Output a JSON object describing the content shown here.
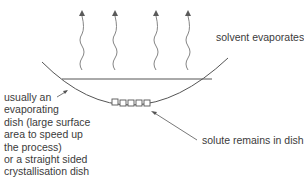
{
  "diagram": {
    "labels": {
      "solvent": "solvent evaporates",
      "solute": "solute remains in dish",
      "dish_lines": [
        "usually an",
        "evaporating",
        "dish (large surface",
        "area to speed up",
        "the process)",
        "or a straight sided",
        "crystallisation dish"
      ]
    },
    "elements": {
      "vapour_arrows": 4,
      "solute_crystals": 5
    },
    "colors": {
      "line": "#555555",
      "arrow": "#666666",
      "text": "#3b3b3b"
    }
  }
}
